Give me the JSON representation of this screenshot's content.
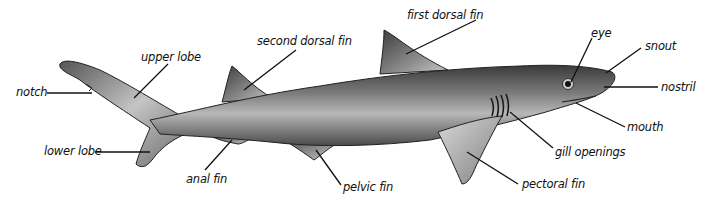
{
  "diagram": {
    "labels": {
      "first_dorsal_fin": "first dorsal fin",
      "second_dorsal_fin": "second dorsal fin",
      "upper_lobe": "upper lobe",
      "notch": "notch",
      "lower_lobe": "lower lobe",
      "anal_fin": "anal fin",
      "pelvic_fin": "pelvic fin",
      "pectoral_fin": "pectoral fin",
      "gill_openings": "gill openings",
      "mouth": "mouth",
      "nostril": "nostril",
      "snout": "snout",
      "eye": "eye"
    },
    "colors": {
      "background": "#ffffff",
      "text": "#111111",
      "leader_line": "#111111",
      "shark_dark": "#3a3a3a",
      "shark_mid": "#8a8a8a",
      "shark_light": "#e6e6e6"
    }
  }
}
